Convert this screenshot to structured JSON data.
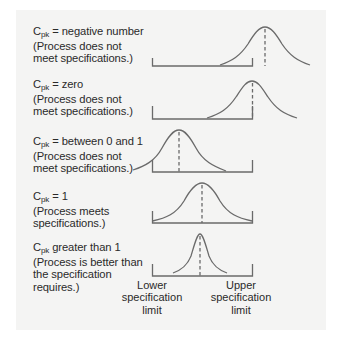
{
  "figure": {
    "rows": [
      {
        "cpk_symbol": "C",
        "cpk_subscript": "pk",
        "condition": " = negative number",
        "explanation_lines": [
          "(Process does not",
          "meet specifications.)"
        ],
        "mean_position": "outside, right of upper limit"
      },
      {
        "cpk_symbol": "C",
        "cpk_subscript": "pk",
        "condition": " = zero",
        "explanation_lines": [
          "(Process does not",
          "meet specifications.)"
        ],
        "mean_position": "at upper limit"
      },
      {
        "cpk_symbol": "C",
        "cpk_subscript": "pk",
        "condition": " = between 0 and 1",
        "explanation_lines": [
          "(Process does not",
          "meet specifications.)"
        ],
        "mean_position": "inside, tail outside lower limit"
      },
      {
        "cpk_symbol": "C",
        "cpk_subscript": "pk",
        "condition": " = 1",
        "explanation_lines": [
          "(Process meets",
          "specifications.)"
        ],
        "mean_position": "centered, tails touch limits"
      },
      {
        "cpk_symbol": "C",
        "cpk_subscript": "pk",
        "condition": " greater than 1",
        "explanation_lines": [
          "(Process is better than",
          "the specification",
          "requires.)"
        ],
        "mean_position": "centered, narrow within limits"
      }
    ],
    "lower_limit_label": [
      "Lower",
      "specification",
      "limit"
    ],
    "upper_limit_label": [
      "Upper",
      "specification",
      "limit"
    ],
    "colors": {
      "panel_background": "#f4f4f3",
      "line": "#6a6a6a",
      "text": "#2a2a2a"
    }
  }
}
